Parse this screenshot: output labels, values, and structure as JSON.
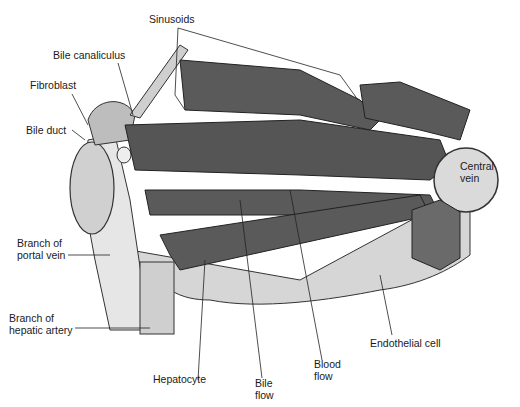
{
  "labels": {
    "sinusoids": "Sinusoids",
    "bile_canaliculus": "Bile canaliculus",
    "fibroblast": "Fibroblast",
    "bile_duct": "Bile duct",
    "central_vein": "Central\nvein",
    "branch_portal_vein": "Branch of\nportal vein",
    "branch_hepatic_artery": "Branch of\nhepatic artery",
    "hepatocyte": "Hepatocyte",
    "bile_flow": "Bile\nflow",
    "blood_flow": "Blood\nflow",
    "endothelial_cell": "Endothelial cell"
  },
  "colors": {
    "cell_fill": "#5a5a5a",
    "tissue_fill": "#d9d9d9",
    "light_fill": "#ececec",
    "outline": "#222222"
  }
}
